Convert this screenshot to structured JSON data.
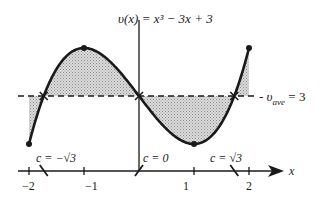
{
  "diagram": {
    "title_parts": {
      "lhs": "υ(x)",
      "rhs": " = x³ − 3x + 3"
    },
    "average_label": {
      "prefix": "- υ",
      "sub": "ave",
      "suffix": " = 3"
    },
    "x_axis_label": "x",
    "x_ticks": [
      {
        "value": -2,
        "label": "−2"
      },
      {
        "value": -1,
        "label": "−1"
      },
      {
        "value": 1,
        "label": "1"
      },
      {
        "value": 2,
        "label": "2"
      }
    ],
    "c_labels": [
      {
        "id": "neg",
        "text": "c = −√3"
      },
      {
        "id": "zero",
        "text": "c = 0"
      },
      {
        "id": "pos",
        "text": "c = √3"
      }
    ],
    "function": "x^3 - 3x + 3",
    "domain": [
      -2,
      2
    ],
    "average_value": 3,
    "intersections_x": [
      -1.732,
      0,
      1.732
    ],
    "marked_points": [
      {
        "x": -2,
        "y": 1
      },
      {
        "x": -1,
        "y": 5
      },
      {
        "x": 1,
        "y": 1
      },
      {
        "x": 2,
        "y": 5
      }
    ],
    "colors": {
      "curve": "#1a1a1a",
      "shade": "#c8c8c8",
      "axis": "#1a1a1a"
    }
  }
}
